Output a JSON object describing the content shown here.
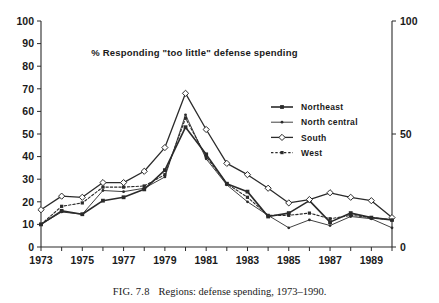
{
  "figure": {
    "caption_number": "FIG. 7.8",
    "caption_text": "Regions: defense spending, 1973–1990."
  },
  "chart_data": {
    "type": "line",
    "title": "% Responding \"too little\" defense spending",
    "xlabel": "",
    "ylabel": "",
    "xlim": [
      1973,
      1990
    ],
    "ylim": [
      0,
      100
    ],
    "grid": false,
    "legend_position": "inside-right",
    "x": [
      1973,
      1974,
      1975,
      1976,
      1977,
      1978,
      1979,
      1980,
      1981,
      1982,
      1983,
      1984,
      1985,
      1986,
      1987,
      1988,
      1989,
      1990
    ],
    "x_tick_values": [
      1973,
      1974,
      1975,
      1976,
      1977,
      1978,
      1979,
      1980,
      1981,
      1982,
      1983,
      1984,
      1985,
      1986,
      1987,
      1988,
      1989,
      1990
    ],
    "x_tick_labels": [
      "1973",
      "",
      "1975",
      "",
      "1977",
      "",
      "1979",
      "",
      "1981",
      "",
      "1983",
      "",
      "1985",
      "",
      "1987",
      "",
      "1989",
      ""
    ],
    "y_ticks_left": [
      0,
      10,
      20,
      30,
      40,
      50,
      60,
      70,
      80,
      90,
      100
    ],
    "y_tick_labels_left": [
      "0",
      "10",
      "20",
      "30",
      "40",
      "50",
      "60",
      "70",
      "80",
      "90",
      "100"
    ],
    "y_ticks_right": [
      0,
      50,
      100
    ],
    "y_tick_labels_right": [
      "0",
      "50",
      "100"
    ],
    "series": [
      {
        "name": "Northeast",
        "marker": "filled-square",
        "dash": "solid",
        "stroke_width": 1.6,
        "values": [
          10,
          16,
          14.5,
          20.5,
          22,
          25.5,
          34,
          53,
          41,
          28,
          24.5,
          13.5,
          15,
          20.5,
          11,
          15,
          13,
          12
        ]
      },
      {
        "name": "North central",
        "marker": "small-dot",
        "dash": "solid",
        "stroke_width": 0.9,
        "values": [
          10,
          15.5,
          14.5,
          25,
          24.5,
          26,
          31,
          58.5,
          39,
          27.5,
          20,
          14,
          8.5,
          12,
          9.5,
          13.5,
          12.5,
          8.5
        ]
      },
      {
        "name": "South",
        "marker": "open-diamond",
        "dash": "solid",
        "stroke_width": 1.3,
        "values": [
          16.5,
          22.5,
          22,
          28.5,
          28.5,
          33.5,
          44,
          68,
          52,
          37,
          32,
          26,
          19.5,
          21,
          24,
          22,
          20.5,
          13
        ]
      },
      {
        "name": "West",
        "marker": "small-square",
        "dash": "dotted",
        "stroke_width": 1.1,
        "values": [
          10,
          18,
          19.5,
          26.5,
          26.5,
          27,
          32,
          57,
          40,
          28,
          22,
          14,
          14,
          15,
          12.5,
          14,
          13,
          12
        ]
      }
    ]
  }
}
